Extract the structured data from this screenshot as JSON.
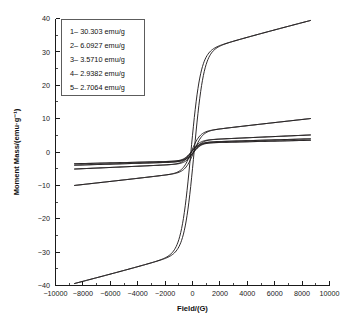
{
  "chart_data": {
    "type": "line",
    "title": "",
    "subtitle": "",
    "xlabel": "Field/(G)",
    "ylabel": "Moment Mass/(emu·g⁻¹)",
    "xlim": [
      -10000,
      10000
    ],
    "ylim": [
      -40,
      40
    ],
    "xticks": [
      -10000,
      -8000,
      -6000,
      -4000,
      -2000,
      0,
      2000,
      4000,
      6000,
      8000,
      10000
    ],
    "xticklabels": [
      "−10000",
      "−8000",
      "−6000",
      "−4000",
      "−2000",
      "0",
      "2000",
      "4000",
      "6000",
      "8000",
      "10000"
    ],
    "yticks": [
      -40,
      -30,
      -20,
      -10,
      0,
      10,
      20,
      30,
      40
    ],
    "yticklabels": [
      "−40",
      "−30",
      "−20",
      "−10",
      "0",
      "10",
      "20",
      "30",
      "40"
    ],
    "grid": false,
    "minor_ticks": true,
    "legend_position": "upper-left",
    "line_color": "#231f20",
    "data_x_range": [
      -8600,
      8600
    ],
    "series": [
      {
        "name": "1",
        "label": "1– 30.303 emu/g",
        "saturation": 30.303,
        "coercivity": 120,
        "remanence": 4.5,
        "approach": 700,
        "slope": 3.5e-05
      },
      {
        "name": "2",
        "label": "2– 6.0927 emu/g",
        "saturation": 6.0927,
        "coercivity": 95,
        "remanence": 0.75,
        "approach": 620,
        "slope": 7.5e-05
      },
      {
        "name": "3",
        "label": "3– 3.5710 emu/g",
        "saturation": 3.571,
        "coercivity": 90,
        "remanence": 0.42,
        "approach": 600,
        "slope": 5e-05
      },
      {
        "name": "4",
        "label": "4– 2.9382 emu/g",
        "saturation": 2.9382,
        "coercivity": 85,
        "remanence": 0.35,
        "approach": 590,
        "slope": 4e-05
      },
      {
        "name": "5",
        "label": "5– 2.7064 emu/g",
        "saturation": 2.7064,
        "coercivity": 80,
        "remanence": 0.3,
        "approach": 580,
        "slope": 3.5e-05
      }
    ]
  },
  "legend": {
    "entries": [
      "1– 30.303 emu/g",
      "2– 6.0927 emu/g",
      "3– 3.5710 emu/g",
      "4– 2.9382 emu/g",
      "5– 2.7064 emu/g"
    ]
  }
}
